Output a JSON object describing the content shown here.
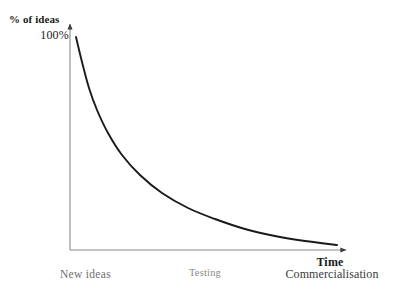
{
  "figure": {
    "background_color": "#ffffff",
    "axis_color": "#808080",
    "curve_color": "#1a1a1a"
  },
  "axes": {
    "y_title": "% of ideas",
    "y_max_label": "100%",
    "x_title": "Time"
  },
  "stages": {
    "new_ideas": "New ideas",
    "testing": "Testing",
    "commercialisation": "Commercialisation"
  },
  "chart_data": {
    "type": "line",
    "title": "",
    "xlabel": "Time",
    "ylabel": "% of ideas",
    "xlim": [
      0,
      100
    ],
    "ylim": [
      0,
      100
    ],
    "grid": false,
    "legend": "none",
    "x_tick_labels": [
      "New ideas",
      "Testing",
      "Commercialisation"
    ],
    "y_tick_labels": [
      "100%"
    ],
    "annotations": [
      "Exponential decay of surviving ideas from New ideas through Testing to Commercialisation"
    ],
    "series": [
      {
        "name": "% of ideas surviving",
        "x": [
          0,
          4,
          8,
          13,
          18,
          24,
          30,
          38,
          46,
          55,
          65,
          75,
          85,
          95,
          100
        ],
        "values": [
          100,
          78,
          62,
          48,
          39,
          31,
          25,
          19,
          15,
          11,
          8,
          6,
          4.5,
          3.5,
          3
        ]
      }
    ],
    "curve_points_px": [
      [
        76,
        37
      ],
      [
        82,
        62
      ],
      [
        89,
        88
      ],
      [
        97,
        110
      ],
      [
        108,
        133
      ],
      [
        122,
        155
      ],
      [
        140,
        175
      ],
      [
        162,
        193
      ],
      [
        188,
        208
      ],
      [
        215,
        219
      ],
      [
        245,
        229
      ],
      [
        275,
        236
      ],
      [
        305,
        241
      ],
      [
        337,
        245
      ]
    ]
  }
}
